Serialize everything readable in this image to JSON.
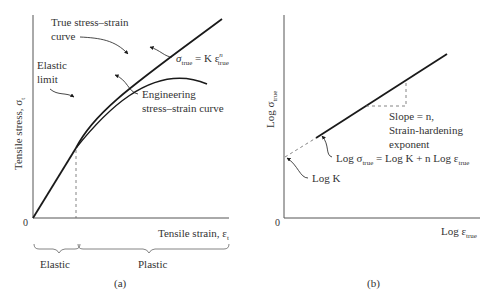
{
  "panel_a": {
    "label": "(a)",
    "ylabel": "Tensile stress, σ",
    "ylabel_sub": "t",
    "xlabel": "Tensile strain, ε",
    "xlabel_sub": "t",
    "origin": "0",
    "true_curve_label_1": "True stress–strain",
    "true_curve_label_2": "curve",
    "elastic_limit_1": "Elastic",
    "elastic_limit_2": "limit",
    "eng_curve_label_1": "Engineering",
    "eng_curve_label_2": "stress–strain curve",
    "equation": {
      "sigma": "σ",
      "sub_true": "true",
      "eq": " = K ε",
      "exp": "n",
      "sub_true2": "true"
    },
    "region_elastic": "Elastic",
    "region_plastic": "Plastic"
  },
  "panel_b": {
    "label": "(b)",
    "ylabel": "Log σ",
    "ylabel_sub": "true",
    "xlabel": "Log ε",
    "xlabel_sub": "true",
    "origin": "0",
    "slope_1": "Slope = n,",
    "slope_2": "Strain-hardening",
    "slope_3": "exponent",
    "equation": {
      "p1": "Log σ",
      "sub1": "true",
      "p2": " = Log K + n Log ε",
      "sub2": "true"
    },
    "logk": "Log K"
  },
  "colors": {
    "line": "#1a1a1a",
    "axis": "#555555",
    "dash": "#666666",
    "text": "#333333"
  }
}
